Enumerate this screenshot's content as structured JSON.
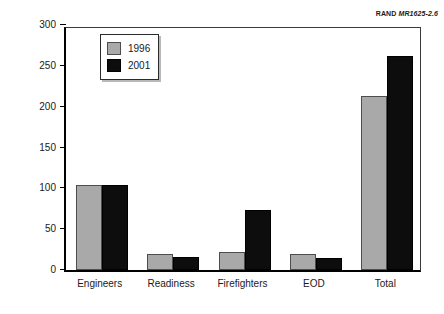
{
  "credit": {
    "organization": "RAND",
    "document_number": "MR1625-2.6"
  },
  "chart_data": {
    "type": "bar",
    "title": "",
    "xlabel": "",
    "ylabel": "Personnel",
    "ylim": [
      0,
      300
    ],
    "yticks": [
      0,
      50,
      100,
      150,
      200,
      250,
      300
    ],
    "ytick_labels": [
      "0",
      "50",
      "100",
      "150",
      "200",
      "250",
      "300"
    ],
    "grid": false,
    "legend_position": "upper left",
    "categories": [
      "Engineers",
      "Readiness",
      "Firefighters",
      "EOD",
      "Total"
    ],
    "series": [
      {
        "name": "1996",
        "color": "#a9a9a9",
        "values": [
          104,
          20,
          22,
          20,
          213
        ]
      },
      {
        "name": "2001",
        "color": "#0d0d0d",
        "values": [
          104,
          16,
          73,
          15,
          262
        ]
      }
    ]
  }
}
